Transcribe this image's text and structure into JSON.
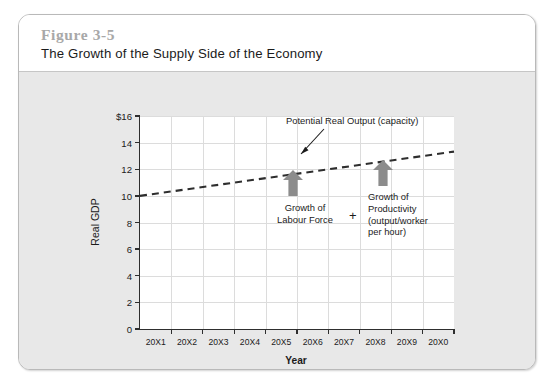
{
  "figure": {
    "number": "Figure 3-5",
    "title": "The Growth of the Supply Side of the Economy"
  },
  "chart_data": {
    "type": "line",
    "title": "The Growth of the Supply Side of the Economy",
    "xlabel": "Year",
    "ylabel": "Real GDP",
    "grid": true,
    "legend": "none",
    "ylim": [
      0,
      16
    ],
    "ytick_labels": [
      "$16",
      "14",
      "12",
      "10",
      "8",
      "6",
      "4",
      "2",
      "0"
    ],
    "ytick_values": [
      16,
      14,
      12,
      10,
      8,
      6,
      4,
      2,
      0
    ],
    "categories": [
      "20X1",
      "20X2",
      "20X3",
      "20X4",
      "20X5",
      "20X6",
      "20X7",
      "20X8",
      "20X9",
      "20X0"
    ],
    "series": [
      {
        "name": "Potential Real Output (capacity)",
        "style": "dashed",
        "color": "#2e2e2e",
        "values": [
          10.0,
          10.35,
          10.7,
          11.05,
          11.4,
          11.75,
          12.1,
          12.45,
          12.8,
          13.15
        ]
      }
    ],
    "annotations": [
      {
        "id": "capacity-callout",
        "text": "Potential Real Output (capacity)",
        "kind": "label-with-arrow"
      },
      {
        "id": "labour-force-arrow",
        "text": "Growth of\nLabour Force",
        "line1": "Growth of",
        "line2": "Labour Force",
        "kind": "up-arrow-with-label",
        "color": "#8c8c8c",
        "at_category": "20X5"
      },
      {
        "id": "plus-operator",
        "text": "+",
        "kind": "operator"
      },
      {
        "id": "productivity-arrow",
        "line1": "Growth of",
        "line2": "Productivity",
        "line3": "(output/worker",
        "line4": "per hour)",
        "kind": "up-arrow-with-label",
        "color": "#8c8c8c",
        "at_category": "20X8"
      }
    ]
  },
  "colors": {
    "panel_background": "#e8e8e8",
    "card_background": "#ffffff",
    "plot_background": "#ffffff",
    "axis": "#2e2e2e",
    "gridline": "#dcdcdc",
    "arrow_gray": "#8c8c8c",
    "figure_number": "#a8a8a8"
  }
}
